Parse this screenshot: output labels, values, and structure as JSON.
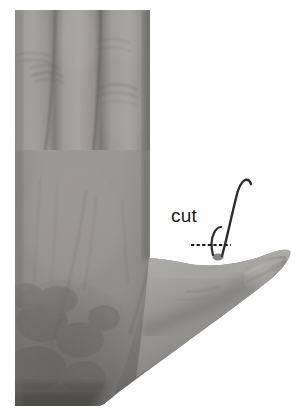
{
  "figure": {
    "kind": "photograph",
    "rendering": "grayscale",
    "width": 308,
    "height": 420,
    "background_color": "#ffffff"
  },
  "photo": {
    "frame": {
      "left": 15,
      "top": 10,
      "right": 291,
      "bottom": 406
    },
    "tones": {
      "skin_light": "#b4b2ae",
      "skin_mid": "#8d8b87",
      "skin_dark": "#6d6b68",
      "shadow": "#4a4845",
      "deep_shadow": "#2e2c2a",
      "paper_white": "#ffffff"
    }
  },
  "annotations": {
    "label": {
      "text": "cut",
      "color": "#1b1b1b",
      "x": 171,
      "y": 205,
      "font_size_px": 19
    },
    "leader_line": {
      "style": "dashed",
      "color": "#171717",
      "x_start": 191,
      "x_end": 231,
      "y": 245,
      "dash_pattern": "3 2"
    },
    "sutures": [
      {
        "name": "long-suture-strand",
        "color": "#2a2a2a",
        "description": "tall thread rising from thumb, curving left at its top"
      },
      {
        "name": "short-suture-hook",
        "color": "#2a2a2a",
        "description": "short hooked thread stub beside the long strand"
      }
    ]
  }
}
